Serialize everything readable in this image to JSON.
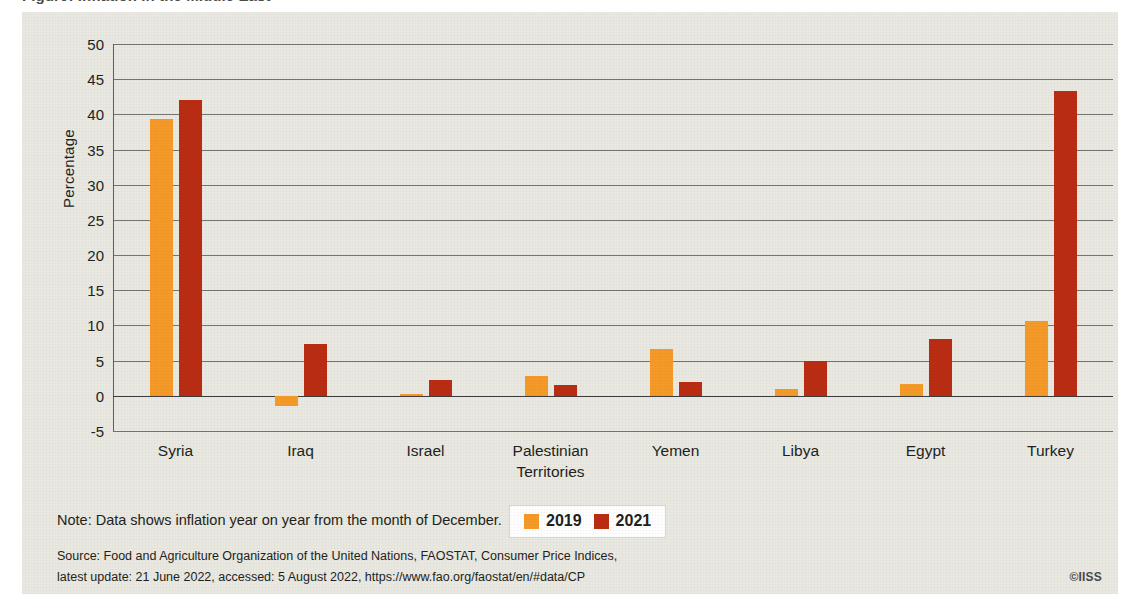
{
  "figure": {
    "title": "Figure: Inflation in the Middle East",
    "credit": "©IISS",
    "note": "Note: Data shows inflation year on year from the month of December.",
    "source_line_1": "Source: Food and Agriculture Organization of the United Nations, FAOSTAT, Consumer Price Indices,",
    "source_line_2": "latest update: 21 June 2022, accessed: 5 August 2022, https://www.fao.org/faostat/en/#data/CP"
  },
  "colors": {
    "series_2019": "#f59a28",
    "series_2021": "#ba2d12",
    "panel_background": "#e9e8e1",
    "gridline": "#5f5f5f",
    "text": "#231f20"
  },
  "chart_data": {
    "type": "bar",
    "title": "",
    "xlabel": "",
    "ylabel": "Percentage",
    "ylim": [
      -5,
      50
    ],
    "ytick_labels": [
      "50",
      "45",
      "40",
      "35",
      "30",
      "25",
      "20",
      "15",
      "10",
      "5",
      "0",
      "-5"
    ],
    "yticks": [
      50,
      45,
      40,
      35,
      30,
      25,
      20,
      15,
      10,
      5,
      0,
      -5
    ],
    "grid": true,
    "legend_position": "bottom-center",
    "categories": [
      "Syria",
      "Iraq",
      "Israel",
      "Palestinian Territories",
      "Yemen",
      "Libya",
      "Egypt",
      "Turkey"
    ],
    "series": [
      {
        "name": "2019",
        "color": "#f59a28",
        "values": [
          39.3,
          -1.5,
          0.3,
          2.8,
          6.7,
          0.9,
          1.7,
          10.6
        ]
      },
      {
        "name": "2021",
        "color": "#ba2d12",
        "values": [
          42.0,
          7.3,
          2.3,
          1.5,
          2.0,
          5.0,
          8.1,
          43.3
        ]
      }
    ]
  }
}
